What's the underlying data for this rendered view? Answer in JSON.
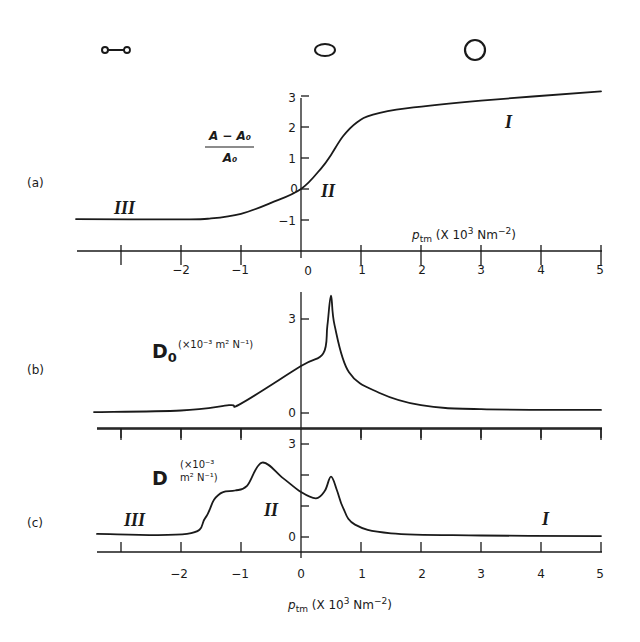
{
  "figure": {
    "shapes": [
      {
        "name": "collapsed-dumbbell",
        "label": ""
      },
      {
        "name": "ellipse",
        "label": ""
      },
      {
        "name": "circle",
        "label": ""
      }
    ],
    "x_axis_label": {
      "sym": "p",
      "sub": "tm",
      "unit_pre": " (X 10",
      "unit_exp": "3",
      "unit_mid": " Nm",
      "unit_exp2": "−2",
      "unit_post": ")"
    },
    "x_tick_labels": [
      "−2",
      "−1",
      "0",
      "1",
      "2",
      "3",
      "4",
      "5"
    ],
    "panels": {
      "a": {
        "label": "(a)",
        "ylabel_num": "A − A₀",
        "ylabel_den": "A₀",
        "y_ticks": [
          "3",
          "2",
          "1",
          "0",
          "−1"
        ],
        "regions": [
          "III",
          "II",
          "I"
        ]
      },
      "b": {
        "label": "(b)",
        "ylabel": "D",
        "ylabel_sub": "0",
        "ylabel_unit": "(×10⁻³ m² N⁻¹)",
        "y_ticks": [
          "3",
          "0"
        ]
      },
      "c": {
        "label": "(c)",
        "ylabel": "D",
        "ylabel_unit_line1": "(×10⁻³",
        "ylabel_unit_line2": "m² N⁻¹)",
        "y_ticks": [
          "3",
          "0"
        ],
        "regions": [
          "III",
          "II",
          "I"
        ]
      }
    }
  },
  "chart_data": [
    {
      "type": "line",
      "title": "(a)",
      "xlabel": "p_tm (× 10^3 Nm^-2)",
      "ylabel": "(A − A0)/A0",
      "xlim": [
        -3.8,
        5
      ],
      "ylim": [
        -1.5,
        3
      ],
      "x_ticks": [
        -3,
        -2,
        -1,
        0,
        1,
        2,
        3,
        4,
        5
      ],
      "y_ticks": [
        -1,
        0,
        1,
        2,
        3
      ],
      "grid": false,
      "annotations": [
        {
          "text": "III",
          "x": -2.85,
          "y": -0.7
        },
        {
          "text": "II",
          "x": 0.4,
          "y": -0.1
        },
        {
          "text": "I",
          "x": 3.45,
          "y": 2.15
        }
      ],
      "series": [
        {
          "name": "area ratio",
          "x": [
            -3.75,
            -2.0,
            -1.5,
            -1.0,
            -0.5,
            0.0,
            0.35,
            0.5,
            0.7,
            0.93,
            1.2,
            1.75,
            3.0,
            5.0
          ],
          "y": [
            -0.97,
            -0.98,
            -0.95,
            -0.8,
            -0.45,
            0.0,
            0.7,
            1.1,
            1.7,
            2.15,
            2.4,
            2.6,
            2.85,
            3.15
          ]
        }
      ]
    },
    {
      "type": "line",
      "title": "(b)",
      "xlabel": "p_tm",
      "ylabel": "D0 (×10^-3 m^2 N^-1)",
      "xlim": [
        -3.8,
        5
      ],
      "ylim": [
        -0.5,
        4
      ],
      "x_ticks": [
        -3,
        -2,
        -1,
        0,
        1,
        2,
        3,
        4,
        5
      ],
      "y_ticks": [
        0,
        3
      ],
      "grid": false,
      "series": [
        {
          "name": "D0",
          "x": [
            -3.45,
            -2.0,
            -1.2,
            -1.0,
            0.0,
            0.37,
            0.44,
            0.5,
            0.56,
            0.8,
            1.3,
            2.0,
            3.0,
            5.0
          ],
          "y": [
            0.03,
            0.08,
            0.25,
            0.3,
            1.5,
            1.9,
            2.8,
            3.75,
            2.8,
            1.3,
            0.65,
            0.25,
            0.12,
            0.1
          ]
        }
      ]
    },
    {
      "type": "line",
      "title": "(c)",
      "xlabel": "p_tm (× 10^3 Nm^-2)",
      "ylabel": "D (×10^-3 m^2 N^-1)",
      "xlim": [
        -3.8,
        5
      ],
      "ylim": [
        -0.5,
        3.5
      ],
      "x_ticks": [
        -3,
        -2,
        -1,
        0,
        1,
        2,
        3,
        4,
        5
      ],
      "y_ticks": [
        0,
        1,
        2,
        3
      ],
      "grid": false,
      "annotations": [
        {
          "text": "III",
          "x": -2.8,
          "y": 0.6
        },
        {
          "text": "II",
          "x": -0.45,
          "y": 0.9
        },
        {
          "text": "I",
          "x": 3.95,
          "y": 0.5
        }
      ],
      "series": [
        {
          "name": "D",
          "x": [
            -3.4,
            -1.9,
            -1.6,
            -1.45,
            -1.3,
            -1.1,
            -0.9,
            -0.65,
            -0.3,
            0.0,
            0.25,
            0.4,
            0.5,
            0.6,
            0.7,
            0.9,
            1.5,
            3.0,
            5.0
          ],
          "y": [
            0.1,
            0.1,
            0.6,
            1.2,
            1.45,
            1.5,
            1.65,
            2.4,
            1.9,
            1.45,
            1.25,
            1.5,
            1.95,
            1.5,
            0.95,
            0.4,
            0.12,
            0.05,
            0.03
          ]
        }
      ]
    }
  ]
}
